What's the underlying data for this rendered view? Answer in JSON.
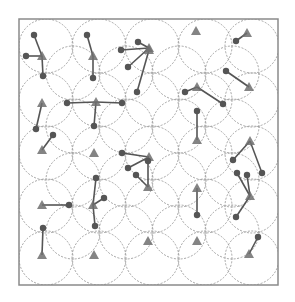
{
  "diagram": {
    "type": "network-coverage",
    "colors": {
      "frame": "#8a8a8a",
      "circle": "#9a9a9a",
      "node": "#555555",
      "link": "#555555",
      "triangle": "#6e6e6e",
      "background": "#ffffff"
    },
    "frame": {
      "x": 19,
      "y": 19,
      "width": 259,
      "height": 266
    },
    "circle_radius": 27,
    "circles": [
      [
        46,
        46
      ],
      [
        99,
        46
      ],
      [
        152,
        46
      ],
      [
        205,
        46
      ],
      [
        252,
        46
      ],
      [
        46,
        100
      ],
      [
        99,
        100
      ],
      [
        152,
        100
      ],
      [
        205,
        100
      ],
      [
        252,
        100
      ],
      [
        46,
        153
      ],
      [
        99,
        153
      ],
      [
        152,
        153
      ],
      [
        205,
        153
      ],
      [
        252,
        153
      ],
      [
        46,
        206
      ],
      [
        99,
        206
      ],
      [
        152,
        206
      ],
      [
        205,
        206
      ],
      [
        252,
        206
      ],
      [
        46,
        258
      ],
      [
        99,
        258
      ],
      [
        152,
        258
      ],
      [
        205,
        258
      ],
      [
        252,
        258
      ],
      [
        73,
        73
      ],
      [
        126,
        73
      ],
      [
        179,
        73
      ],
      [
        232,
        73
      ],
      [
        73,
        126
      ],
      [
        126,
        126
      ],
      [
        179,
        126
      ],
      [
        232,
        126
      ],
      [
        73,
        180
      ],
      [
        126,
        180
      ],
      [
        179,
        180
      ],
      [
        232,
        180
      ],
      [
        73,
        232
      ],
      [
        126,
        232
      ],
      [
        179,
        232
      ],
      [
        232,
        232
      ]
    ],
    "triangles": [
      {
        "x": 42,
        "y": 56
      },
      {
        "x": 93,
        "y": 56
      },
      {
        "x": 149,
        "y": 48
      },
      {
        "x": 196,
        "y": 31
      },
      {
        "x": 247,
        "y": 33
      },
      {
        "x": 42,
        "y": 103
      },
      {
        "x": 96,
        "y": 102
      },
      {
        "x": 149,
        "y": 50
      },
      {
        "x": 197,
        "y": 87
      },
      {
        "x": 249,
        "y": 87
      },
      {
        "x": 42,
        "y": 150
      },
      {
        "x": 94,
        "y": 153
      },
      {
        "x": 149,
        "y": 157
      },
      {
        "x": 197,
        "y": 140
      },
      {
        "x": 250,
        "y": 141
      },
      {
        "x": 42,
        "y": 205
      },
      {
        "x": 93,
        "y": 205
      },
      {
        "x": 148,
        "y": 187
      },
      {
        "x": 197,
        "y": 188
      },
      {
        "x": 250,
        "y": 196
      },
      {
        "x": 42,
        "y": 255
      },
      {
        "x": 94,
        "y": 255
      },
      {
        "x": 148,
        "y": 241
      },
      {
        "x": 197,
        "y": 241
      },
      {
        "x": 249,
        "y": 254
      }
    ],
    "nodes": [
      {
        "x": 34,
        "y": 35,
        "to": 0
      },
      {
        "x": 26,
        "y": 56,
        "to": 0
      },
      {
        "x": 43,
        "y": 76,
        "to": 0
      },
      {
        "x": 87,
        "y": 35,
        "to": 1
      },
      {
        "x": 93,
        "y": 78,
        "to": 1
      },
      {
        "x": 138,
        "y": 42,
        "to": 2
      },
      {
        "x": 121,
        "y": 50,
        "to": 2
      },
      {
        "x": 128,
        "y": 67,
        "to": 2
      },
      {
        "x": 236,
        "y": 41,
        "to": 4
      },
      {
        "x": 67,
        "y": 103,
        "to": 6
      },
      {
        "x": 122,
        "y": 103,
        "to": 6
      },
      {
        "x": 94,
        "y": 126,
        "to": 6
      },
      {
        "x": 36,
        "y": 129,
        "to": 5
      },
      {
        "x": 185,
        "y": 92,
        "to": 8
      },
      {
        "x": 223,
        "y": 104,
        "to": 8
      },
      {
        "x": 226,
        "y": 71,
        "to": 9
      },
      {
        "x": 137,
        "y": 92,
        "to": 7
      },
      {
        "x": 53,
        "y": 135,
        "to": 10
      },
      {
        "x": 122,
        "y": 153,
        "to": 12
      },
      {
        "x": 128,
        "y": 168,
        "to": 12
      },
      {
        "x": 197,
        "y": 111,
        "to": 13
      },
      {
        "x": 233,
        "y": 160,
        "to": 14
      },
      {
        "x": 262,
        "y": 173,
        "to": 14
      },
      {
        "x": 69,
        "y": 205,
        "to": 15
      },
      {
        "x": 96,
        "y": 178,
        "to": 16
      },
      {
        "x": 104,
        "y": 198,
        "to": 16
      },
      {
        "x": 95,
        "y": 226,
        "to": 16
      },
      {
        "x": 43,
        "y": 228,
        "to": 20
      },
      {
        "x": 148,
        "y": 161,
        "to": 17
      },
      {
        "x": 136,
        "y": 175,
        "to": 17
      },
      {
        "x": 197,
        "y": 215,
        "to": 18
      },
      {
        "x": 237,
        "y": 173,
        "to": 19
      },
      {
        "x": 247,
        "y": 175,
        "to": 19
      },
      {
        "x": 236,
        "y": 217,
        "to": 19
      },
      {
        "x": 258,
        "y": 237,
        "to": 24
      }
    ],
    "label": "Coverage / clustering diagram"
  }
}
